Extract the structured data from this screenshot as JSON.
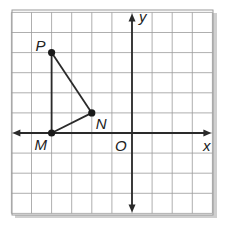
{
  "figure": {
    "type": "coordinate-plane",
    "grid": {
      "x_min": -6,
      "x_max": 4,
      "y_min": -4,
      "y_max": 6,
      "unit_px": 20.1,
      "origin_px": [
        132,
        133
      ],
      "grid_color": "#9a9a9a",
      "axis_color": "#2a2a2a",
      "shadow_color": "#c8c8c8"
    },
    "axes": {
      "x_label": "x",
      "y_label": "y",
      "origin_label": "O"
    },
    "points": [
      {
        "name": "P",
        "label": "P",
        "x": -4,
        "y": 4
      },
      {
        "name": "N",
        "label": "N",
        "x": -2,
        "y": 1
      },
      {
        "name": "M",
        "label": "M",
        "x": -4,
        "y": 0
      }
    ],
    "segments": [
      [
        "P",
        "N"
      ],
      [
        "N",
        "M"
      ],
      [
        "M",
        "P"
      ]
    ],
    "shape": "triangle PNM"
  }
}
